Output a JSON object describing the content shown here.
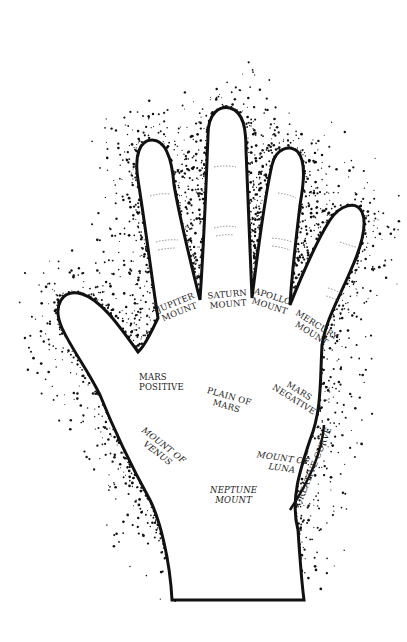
{
  "diagram": {
    "type": "palmistry-hand-map",
    "colors": {
      "ink": "#111111",
      "paper": "#ffffff",
      "text": "#1a1a1a"
    },
    "labels": {
      "jupiter": {
        "line1": "JUPITER",
        "line2": "MOUNT"
      },
      "saturn": {
        "line1": "SATURN",
        "line2": "MOUNT"
      },
      "apollo": {
        "line1": "APOLLO",
        "line2": "MOUNT"
      },
      "mercury": {
        "line1": "MERCURY",
        "line2": "MOUNT"
      },
      "mars_pos": {
        "line1": "MARS",
        "line2": "POSITIVE"
      },
      "plain": {
        "line1": "PLAIN OF",
        "line2": "MARS"
      },
      "mars_neg": {
        "line1": "MARS",
        "line2": "NEGATIVE"
      },
      "venus": {
        "line1": "MOUNT OF",
        "line2": "VENUS"
      },
      "luna": {
        "line1": "MOUNT OF",
        "line2": "LUNA"
      },
      "neptune": {
        "line1": "NEPTUNE",
        "line2": "MOUNT"
      },
      "creative": {
        "line1": "CREATIVE CURVE"
      }
    }
  }
}
